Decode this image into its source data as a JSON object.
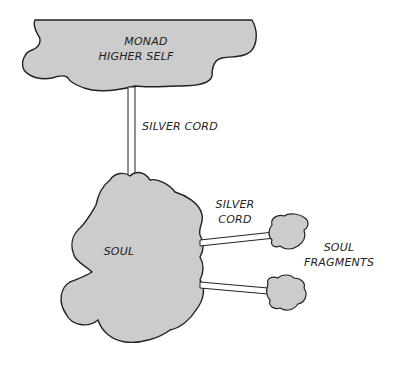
{
  "diagram": {
    "nodes": {
      "monad": {
        "line1": "MONAD",
        "line2": "HIGHER SELF"
      },
      "soul": {
        "label": "SOUL"
      },
      "fragments": {
        "line1": "SOUL",
        "line2": "FRAGMENTS"
      }
    },
    "edges": {
      "cord_monad_soul": {
        "label": "SILVER CORD"
      },
      "cord_soul_fragments": {
        "line1": "SILVER",
        "line2": "CORD"
      }
    },
    "colors": {
      "fill": "#cccccc",
      "stroke": "#222222",
      "cord_fill": "#ffffff"
    }
  }
}
